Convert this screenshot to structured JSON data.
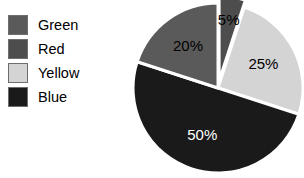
{
  "background_color": "#ffffff",
  "legend": {
    "items": [
      {
        "label": "Green",
        "color": "#5a5a5a"
      },
      {
        "label": "Red",
        "color": "#4d4d4d"
      },
      {
        "label": "Yellow",
        "color": "#d4d4d4"
      },
      {
        "label": "Blue",
        "color": "#1a1a1a"
      }
    ]
  },
  "chart_data": {
    "type": "pie",
    "title": "",
    "labels": [
      "Red",
      "Yellow",
      "Blue",
      "Green"
    ],
    "values": [
      5,
      25,
      50,
      20
    ],
    "value_labels": [
      "5%",
      "25%",
      "50%",
      "20%"
    ],
    "colors": [
      "#4d4d4d",
      "#d4d4d4",
      "#1a1a1a",
      "#5a5a5a"
    ],
    "label_text_colors": [
      "#000000",
      "#000000",
      "#ffffff",
      "#000000"
    ],
    "start_angle_deg": 0,
    "direction": "clockwise",
    "exploded": [
      true,
      false,
      false,
      false
    ],
    "legend_position": "left",
    "grid": false
  }
}
